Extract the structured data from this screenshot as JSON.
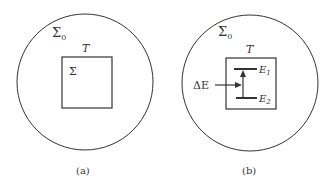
{
  "panels": [
    {
      "id": "a",
      "caption": "(a)",
      "outer_label": "Σ",
      "outer_sub": "0",
      "box_label": "T",
      "inner_label": "Σ"
    },
    {
      "id": "b",
      "caption": "(b)",
      "outer_label": "Σ",
      "outer_sub": "0",
      "box_label": "T",
      "arrow_label": "ΔE",
      "level_upper": "E",
      "level_upper_sub": "1",
      "level_lower": "E",
      "level_lower_sub": "2"
    }
  ],
  "colors": {
    "stroke": "#333333",
    "text": "#333333",
    "background": "#ffffff"
  }
}
